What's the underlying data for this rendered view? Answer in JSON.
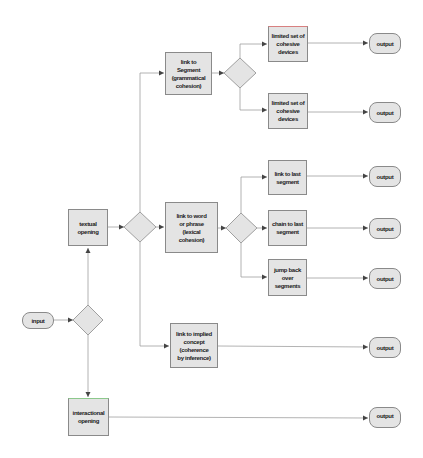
{
  "diagram": {
    "colors": {
      "node_fill": "#e4e4e4",
      "node_border": "#8a8a8a",
      "line": "#a0a0a0",
      "arrow": "#444444",
      "text": "#222222"
    },
    "nodes": {
      "input": "input",
      "textual_opening": "textual\nopening",
      "interactional_opening": "interactional\nopening",
      "link_to_segment": "link to\nSegment\n(grammatical\ncohesion)",
      "link_to_word": "link to word\nor phrase\n(lexical\ncohesion)",
      "link_to_implied": "link to implied\nconcept\n(coherence\nby inference)",
      "limited_set_1": "limited set of\ncohesive\ndevices",
      "limited_set_2": "limited set of\ncohesive\ndevices",
      "link_to_last": "link to last\nsegment",
      "chain_to_last": "chain to last\nsegment",
      "jump_back": "jump back\nover\nsegments",
      "output_1": "output",
      "output_2": "output",
      "output_3": "output",
      "output_4": "output",
      "output_5": "output",
      "output_6": "output",
      "output_7": "output"
    },
    "edges": [
      {
        "from": "input",
        "to": "decision_1"
      },
      {
        "from": "decision_1",
        "to": "textual_opening"
      },
      {
        "from": "decision_1",
        "to": "interactional_opening"
      },
      {
        "from": "textual_opening",
        "to": "decision_2"
      },
      {
        "from": "decision_2",
        "to": "link_to_segment"
      },
      {
        "from": "decision_2",
        "to": "link_to_word"
      },
      {
        "from": "decision_2",
        "to": "link_to_implied"
      },
      {
        "from": "link_to_segment",
        "to": "decision_3"
      },
      {
        "from": "decision_3",
        "to": "limited_set_1"
      },
      {
        "from": "decision_3",
        "to": "limited_set_2"
      },
      {
        "from": "limited_set_1",
        "to": "output_1"
      },
      {
        "from": "limited_set_2",
        "to": "output_2"
      },
      {
        "from": "link_to_word",
        "to": "decision_4"
      },
      {
        "from": "decision_4",
        "to": "link_to_last"
      },
      {
        "from": "decision_4",
        "to": "chain_to_last"
      },
      {
        "from": "decision_4",
        "to": "jump_back"
      },
      {
        "from": "link_to_last",
        "to": "output_3"
      },
      {
        "from": "chain_to_last",
        "to": "output_4"
      },
      {
        "from": "jump_back",
        "to": "output_5"
      },
      {
        "from": "link_to_implied",
        "to": "output_6"
      },
      {
        "from": "interactional_opening",
        "to": "output_7"
      }
    ]
  }
}
